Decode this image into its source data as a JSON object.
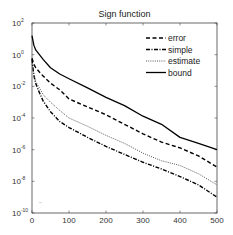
{
  "chart_data": {
    "type": "line",
    "title": "Sign function",
    "xlabel": "",
    "ylabel": "",
    "xscale": "linear",
    "yscale": "log",
    "xlim": [
      0,
      500
    ],
    "ylim": [
      1e-10,
      100
    ],
    "grid": false,
    "legend_position": "upper right",
    "x_ticks": [
      0,
      100,
      200,
      300,
      400,
      500
    ],
    "x_tick_labels": [
      "0",
      "100",
      "200",
      "300",
      "400",
      "500"
    ],
    "y_ticks": [
      100,
      1,
      0.01,
      0.0001,
      1e-06,
      1e-08,
      1e-10
    ],
    "y_tick_labels": [
      {
        "base": "10",
        "exp": "2"
      },
      {
        "base": "10",
        "exp": "0"
      },
      {
        "base": "10",
        "exp": "-2"
      },
      {
        "base": "10",
        "exp": "-4"
      },
      {
        "base": "10",
        "exp": "-6"
      },
      {
        "base": "10",
        "exp": "-8"
      },
      {
        "base": "10",
        "exp": "-10"
      }
    ],
    "x": [
      0,
      5,
      10,
      20,
      30,
      50,
      75,
      100,
      150,
      200,
      250,
      300,
      350,
      400,
      450,
      500
    ],
    "series": [
      {
        "name": "error",
        "style": "dashed",
        "color": "#000000",
        "values": [
          0.6,
          0.25,
          0.15,
          0.08,
          0.045,
          0.016,
          0.006,
          0.0016,
          0.0005,
          0.00016,
          4e-05,
          1e-05,
          3e-06,
          1.3e-06,
          4e-07,
          8e-08
        ]
      },
      {
        "name": "simple",
        "style": "dashdot",
        "color": "#000000",
        "values": [
          0.5,
          0.05,
          0.015,
          0.004,
          0.0012,
          0.00025,
          6e-05,
          2.5e-05,
          6e-06,
          1.6e-06,
          5e-07,
          1.6e-07,
          6e-08,
          2e-08,
          6e-09,
          1e-09
        ]
      },
      {
        "name": "estimate",
        "style": "dotted",
        "color": "#555555",
        "values": [
          0.25,
          0.06,
          0.02,
          0.008,
          0.003,
          0.001,
          0.0003,
          0.0001,
          3e-05,
          8e-06,
          2.5e-06,
          6e-07,
          2e-07,
          1e-07,
          3e-08,
          6e-09
        ]
      },
      {
        "name": "bound",
        "style": "solid",
        "color": "#000000",
        "values": [
          16,
          4,
          2,
          1,
          0.5,
          0.15,
          0.06,
          0.03,
          0.008,
          0.002,
          0.0006,
          0.00013,
          4e-05,
          6e-06,
          2.5e-06,
          1e-06
        ]
      }
    ]
  },
  "legend": {
    "items": [
      {
        "label": "error",
        "style": "dashed"
      },
      {
        "label": "simple",
        "style": "dashdot"
      },
      {
        "label": "estimate",
        "style": "dotted"
      },
      {
        "label": "bound",
        "style": "solid"
      }
    ]
  }
}
